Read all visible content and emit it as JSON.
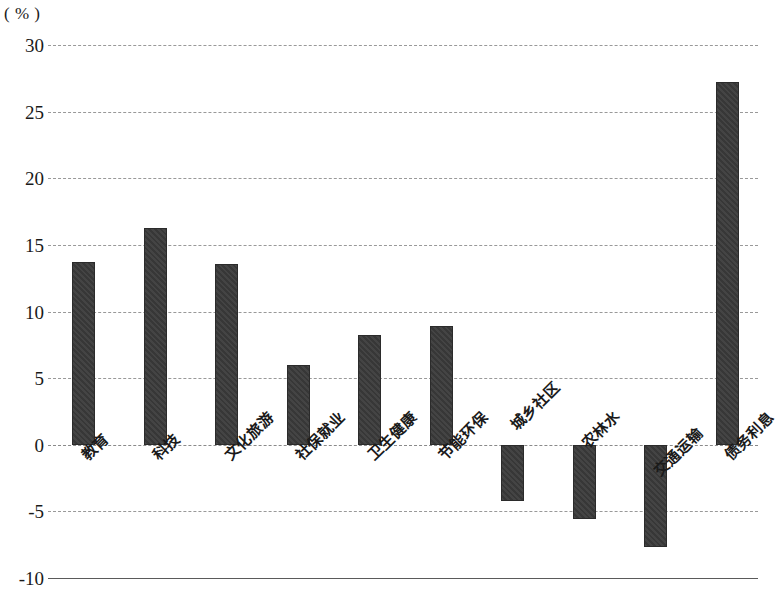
{
  "chart_data": {
    "type": "bar",
    "title": "",
    "subtitle": "",
    "xlabel": "",
    "ylabel": "",
    "unit_label": "( % )",
    "ylim": [
      -10,
      30
    ],
    "ytick_step": 5,
    "yticks": [
      "30",
      "25",
      "20",
      "15",
      "10",
      "5",
      "0",
      "-5",
      "-10"
    ],
    "ytick_values": [
      30,
      25,
      20,
      15,
      10,
      5,
      0,
      -5,
      -10
    ],
    "grid": true,
    "grid_style": "dashed",
    "legend": "none",
    "bar_color": "#3a3a3a",
    "categories": [
      "教育",
      "科技",
      "文化旅游",
      "社保就业",
      "卫生健康",
      "节能环保",
      "城乡社区",
      "农林水",
      "交通运输",
      "债务利息"
    ],
    "values": [
      13.7,
      16.3,
      13.6,
      6.0,
      8.2,
      8.9,
      -4.2,
      -5.6,
      -7.7,
      27.2
    ]
  }
}
